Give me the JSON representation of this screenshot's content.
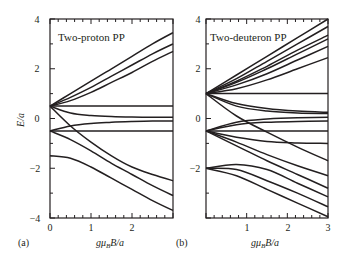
{
  "figure": {
    "panel_a_letter": "(a)",
    "panel_b_letter": "(b)",
    "ylabel": "E/a",
    "xlabel_a": "gμBB/a",
    "xlabel_b": "gμBB/a"
  },
  "chart_data": [
    {
      "type": "line",
      "panel": "(a)",
      "title": "Two-proton PP",
      "xlabel": "gμ_B B/a",
      "ylabel": "E/a",
      "xlim": [
        0,
        3
      ],
      "ylim": [
        -4,
        4
      ],
      "xticks": [
        0,
        1,
        2
      ],
      "yticks": [
        -4,
        -2,
        0,
        2,
        4
      ],
      "grid": false,
      "series": [
        {
          "name": "level 1",
          "x": [
            0,
            0.5,
            1,
            1.5,
            2,
            2.5,
            3
          ],
          "y": [
            0.5,
            1.0,
            1.5,
            2.0,
            2.5,
            3.0,
            3.45
          ]
        },
        {
          "name": "level 2",
          "x": [
            0,
            0.5,
            1,
            1.5,
            2,
            2.5,
            3
          ],
          "y": [
            0.5,
            0.85,
            1.25,
            1.7,
            2.15,
            2.6,
            3.0
          ]
        },
        {
          "name": "level 3",
          "x": [
            0,
            0.5,
            1,
            1.5,
            2,
            2.5,
            3
          ],
          "y": [
            0.5,
            0.72,
            1.05,
            1.45,
            1.85,
            2.3,
            2.7
          ]
        },
        {
          "name": "level 4",
          "x": [
            0,
            3
          ],
          "y": [
            0.5,
            0.5
          ]
        },
        {
          "name": "level 5",
          "x": [
            0,
            0.5,
            1,
            1.5,
            2,
            2.5,
            3
          ],
          "y": [
            0.5,
            0.22,
            0.12,
            0.08,
            0.06,
            0.05,
            0.05
          ]
        },
        {
          "name": "level 6",
          "x": [
            0,
            0.5,
            1,
            1.5,
            2,
            2.5,
            3
          ],
          "y": [
            0.5,
            -0.3,
            -0.95,
            -1.5,
            -1.95,
            -2.25,
            -2.5
          ]
        },
        {
          "name": "level 7",
          "x": [
            0,
            0.5,
            1,
            1.5,
            2,
            2.5,
            3
          ],
          "y": [
            -0.5,
            -0.3,
            -0.2,
            -0.15,
            -0.12,
            -0.1,
            -0.1
          ]
        },
        {
          "name": "level 8",
          "x": [
            0,
            3
          ],
          "y": [
            -0.5,
            -0.5
          ]
        },
        {
          "name": "level 9",
          "x": [
            0,
            0.5,
            1,
            1.5,
            2,
            2.5,
            3
          ],
          "y": [
            -0.5,
            -0.85,
            -1.3,
            -1.8,
            -2.25,
            -2.7,
            -3.1
          ]
        },
        {
          "name": "level 10",
          "x": [
            0,
            0.5,
            1,
            1.5,
            2,
            2.5,
            3
          ],
          "y": [
            -1.5,
            -1.6,
            -1.95,
            -2.4,
            -2.85,
            -3.3,
            -3.7
          ]
        }
      ]
    },
    {
      "type": "line",
      "panel": "(b)",
      "title": "Two-deuteron PP",
      "xlabel": "gμ_B B/a",
      "ylabel": "",
      "xlim": [
        0,
        3
      ],
      "ylim": [
        -4,
        4
      ],
      "xticks": [
        1,
        2,
        3
      ],
      "yticks": [
        -2,
        0,
        2,
        4
      ],
      "grid": false,
      "series": [
        {
          "name": "level 1",
          "x": [
            0,
            0.75,
            1.5,
            2.25,
            3
          ],
          "y": [
            1.0,
            1.75,
            2.5,
            3.25,
            4.0
          ]
        },
        {
          "name": "level 2",
          "x": [
            0,
            0.75,
            1.5,
            2.25,
            3
          ],
          "y": [
            1.0,
            1.6,
            2.3,
            3.0,
            3.7
          ]
        },
        {
          "name": "level 3",
          "x": [
            0,
            0.75,
            1.5,
            2.25,
            3
          ],
          "y": [
            1.0,
            1.5,
            2.1,
            2.75,
            3.35
          ]
        },
        {
          "name": "level 4",
          "x": [
            0,
            0.75,
            1.5,
            2.25,
            3
          ],
          "y": [
            1.0,
            1.45,
            2.0,
            2.6,
            3.2
          ]
        },
        {
          "name": "level 5",
          "x": [
            0,
            0.75,
            1.5,
            2.25,
            3
          ],
          "y": [
            1.0,
            1.35,
            1.8,
            2.35,
            2.9
          ]
        },
        {
          "name": "level 6",
          "x": [
            0,
            0.75,
            1.5,
            2.25,
            3
          ],
          "y": [
            1.0,
            1.2,
            1.55,
            2.0,
            2.45
          ]
        },
        {
          "name": "level 7",
          "x": [
            0,
            3
          ],
          "y": [
            1.0,
            1.0
          ]
        },
        {
          "name": "level 8",
          "x": [
            0,
            0.75,
            1.5,
            2.25,
            3
          ],
          "y": [
            1.0,
            0.6,
            0.4,
            0.3,
            0.25
          ]
        },
        {
          "name": "level 9",
          "x": [
            0,
            0.75,
            1.5,
            2.25,
            3
          ],
          "y": [
            1.0,
            0.5,
            0.3,
            0.22,
            0.2
          ]
        },
        {
          "name": "level 10",
          "x": [
            0,
            0.75,
            1.5,
            2.25,
            3
          ],
          "y": [
            1.0,
            0.1,
            -0.55,
            -1.15,
            -1.7
          ]
        },
        {
          "name": "level 11",
          "x": [
            0,
            0.75,
            1.5,
            2.25,
            3
          ],
          "y": [
            -0.5,
            -0.15,
            -0.02,
            0.03,
            0.05
          ]
        },
        {
          "name": "level 12",
          "x": [
            0,
            0.75,
            1.5,
            2.25,
            3
          ],
          "y": [
            -0.5,
            -0.25,
            -0.15,
            -0.12,
            -0.1
          ]
        },
        {
          "name": "level 13",
          "x": [
            0,
            3
          ],
          "y": [
            -0.5,
            -0.5
          ]
        },
        {
          "name": "level 14",
          "x": [
            0,
            0.75,
            1.5,
            2.25,
            3
          ],
          "y": [
            -0.5,
            -0.75,
            -0.92,
            -0.98,
            -1.0
          ]
        },
        {
          "name": "level 15",
          "x": [
            0,
            0.75,
            1.5,
            2.25,
            3
          ],
          "y": [
            -0.5,
            -0.95,
            -1.45,
            -1.9,
            -2.3
          ]
        },
        {
          "name": "level 16",
          "x": [
            0,
            0.75,
            1.5,
            2.25,
            3
          ],
          "y": [
            -0.5,
            -1.1,
            -1.7,
            -2.25,
            -2.8
          ]
        },
        {
          "name": "level 17",
          "x": [
            0,
            0.75,
            1.5,
            2.25,
            3
          ],
          "y": [
            -2.0,
            -1.85,
            -2.05,
            -2.6,
            -3.15
          ]
        },
        {
          "name": "level 18",
          "x": [
            0,
            0.75,
            1.5,
            2.25,
            3
          ],
          "y": [
            -2.0,
            -2.05,
            -2.5,
            -3.0,
            -3.55
          ]
        },
        {
          "name": "level 19",
          "x": [
            0,
            0.75,
            1.5,
            2.25,
            3
          ],
          "y": [
            -2.0,
            -2.3,
            -2.85,
            -3.4,
            -3.95
          ]
        }
      ]
    }
  ]
}
